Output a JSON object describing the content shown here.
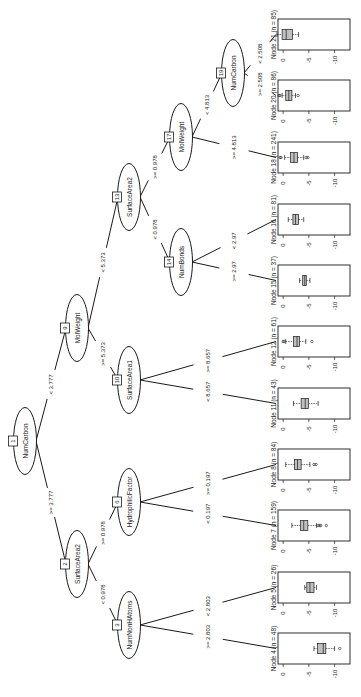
{
  "orientation": "rotated-90-clockwise",
  "axis": {
    "ticks": [
      0,
      -5,
      -10
    ],
    "tick_labels": [
      "0",
      "-5",
      "-10"
    ],
    "range": [
      1,
      -13
    ]
  },
  "inner_nodes": [
    {
      "id": 1,
      "label": "NumCarbon",
      "cx": 25,
      "cy": 441
    },
    {
      "id": 2,
      "label": "SurfaceArea2",
      "cx": 77,
      "cy": 564
    },
    {
      "id": 3,
      "label": "NumNonHAtoms",
      "cx": 129,
      "cy": 625
    },
    {
      "id": 6,
      "label": "HydrophilicFactor",
      "cx": 129,
      "cy": 502
    },
    {
      "id": 9,
      "label": "MolWeight",
      "cx": 77,
      "cy": 328
    },
    {
      "id": 10,
      "label": "SurfaceArea1",
      "cx": 129,
      "cy": 380
    },
    {
      "id": 13,
      "label": "SurfaceArea2",
      "cx": 129,
      "cy": 197
    },
    {
      "id": 14,
      "label": "NumBonds",
      "cx": 181,
      "cy": 262
    },
    {
      "id": 17,
      "label": "MolWeight",
      "cx": 181,
      "cy": 137
    },
    {
      "id": 19,
      "label": "NumCarbon",
      "cx": 233,
      "cy": 73
    }
  ],
  "edges": [
    {
      "from": 1,
      "to": 9,
      "label": "< 3.777"
    },
    {
      "from": 1,
      "to": 2,
      "label": ">= 3.777"
    },
    {
      "from": 2,
      "to": 3,
      "label": "< 0.978"
    },
    {
      "from": 2,
      "to": 6,
      "label": ">= 0.978"
    },
    {
      "from": 3,
      "to": 4,
      "label": ">= 2.803"
    },
    {
      "from": 3,
      "to": 5,
      "label": "< 2.803"
    },
    {
      "from": 6,
      "to": 7,
      "label": "< 0.197"
    },
    {
      "from": 6,
      "to": 8,
      "label": ">= 0.197"
    },
    {
      "from": 9,
      "to": 13,
      "label": "< 5.373"
    },
    {
      "from": 9,
      "to": 10,
      "label": ">= 5.373"
    },
    {
      "from": 10,
      "to": 11,
      "label": "< 8.657"
    },
    {
      "from": 10,
      "to": 12,
      "label": ">= 8.657"
    },
    {
      "from": 13,
      "to": 14,
      "label": "< 0.978"
    },
    {
      "from": 13,
      "to": 17,
      "label": ">= 0.978"
    },
    {
      "from": 14,
      "to": 15,
      "label": ">= 2.97"
    },
    {
      "from": 14,
      "to": 16,
      "label": "< 2.97"
    },
    {
      "from": 17,
      "to": 18,
      "label": ">= 4.813"
    },
    {
      "from": 17,
      "to": 19,
      "label": "< 4.813"
    },
    {
      "from": 19,
      "to": 20,
      "label": ">= 2.508"
    },
    {
      "from": 19,
      "to": 21,
      "label": "< 2.508"
    }
  ],
  "leaves": [
    {
      "id": 21,
      "n": 85,
      "label": "Node 21 (n = 85)",
      "top": 19,
      "box": {
        "wlo": 1.2,
        "q1": 0.2,
        "med": -0.6,
        "q3": -1.8,
        "whi": -3.0
      },
      "outliers": []
    },
    {
      "id": 20,
      "n": 86,
      "label": "Node 20 (n = 86)",
      "top": 80,
      "box": {
        "wlo": 0.2,
        "q1": -0.5,
        "med": -1.1,
        "q3": -1.7,
        "whi": -2.4
      },
      "outliers": [
        0.8,
        0.6,
        -2.9
      ]
    },
    {
      "id": 18,
      "n": 241,
      "label": "Node 18 (n = 241)",
      "top": 142,
      "box": {
        "wlo": -0.3,
        "q1": -1.4,
        "med": -2.1,
        "q3": -2.8,
        "whi": -4.0
      },
      "outliers": [
        0.6,
        0.4,
        -4.5,
        -4.8
      ]
    },
    {
      "id": 16,
      "n": 81,
      "label": "Node 16 (n = 81)",
      "top": 204,
      "box": {
        "wlo": -1.0,
        "q1": -1.9,
        "med": -2.4,
        "q3": -3.0,
        "whi": -4.0
      },
      "outliers": []
    },
    {
      "id": 15,
      "n": 37,
      "label": "Node 15 (n = 37)",
      "top": 265,
      "box": {
        "wlo": -3.2,
        "q1": -3.8,
        "med": -4.2,
        "q3": -4.5,
        "whi": -5.2
      },
      "outliers": []
    },
    {
      "id": 12,
      "n": 61,
      "label": "Node 12 (n = 61)",
      "top": 326,
      "box": {
        "wlo": -0.5,
        "q1": -2.0,
        "med": -2.7,
        "q3": -3.2,
        "whi": -4.4
      },
      "outliers": [
        0.0,
        -0.2,
        -5.6
      ]
    },
    {
      "id": 11,
      "n": 43,
      "label": "Node 11 (n = 43)",
      "top": 388,
      "box": {
        "wlo": -2.0,
        "q1": -3.5,
        "med": -4.3,
        "q3": -4.9,
        "whi": -6.8
      },
      "outliers": []
    },
    {
      "id": 8,
      "n": 84,
      "label": "Node 8 (n = 84)",
      "top": 449,
      "box": {
        "wlo": -0.5,
        "q1": -2.2,
        "med": -2.8,
        "q3": -3.5,
        "whi": -5.2
      },
      "outliers": [
        -6.0,
        -6.4
      ]
    },
    {
      "id": 7,
      "n": 159,
      "label": "Node 7 (n = 159)",
      "top": 510,
      "box": {
        "wlo": -1.7,
        "q1": -3.4,
        "med": -4.0,
        "q3": -4.8,
        "whi": -6.5
      },
      "outliers": [
        -6.8,
        -7.1,
        -7.3,
        -8.4
      ]
    },
    {
      "id": 5,
      "n": 26,
      "label": "Node 5 (n = 26)",
      "top": 572,
      "box": {
        "wlo": -4.2,
        "q1": -4.6,
        "med": -5.2,
        "q3": -6.0,
        "whi": -6.5
      },
      "outliers": []
    },
    {
      "id": 4,
      "n": 48,
      "label": "Node 4 (n = 48)",
      "top": 633,
      "box": {
        "wlo": -6.0,
        "q1": -6.7,
        "med": -7.8,
        "q3": -8.3,
        "whi": -10.0
      },
      "outliers": [
        -11.0
      ]
    }
  ]
}
